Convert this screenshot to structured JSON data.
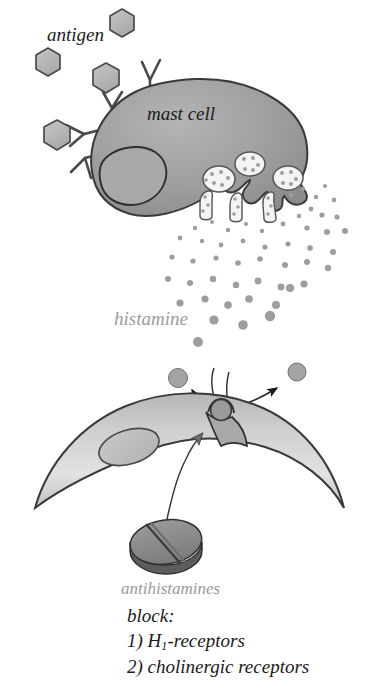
{
  "figure": {
    "width": 367,
    "height": 699,
    "background": "#ffffff"
  },
  "labels": {
    "antigen": "antigen",
    "mast_cell": "mast cell",
    "histamine": "histamine",
    "antihistamines": "antihistamines",
    "block": "block:",
    "receptor_1_prefix": "1) H",
    "receptor_1_sub": "1",
    "receptor_1_suffix": "-receptors",
    "receptor_2": "2) cholinergic receptors"
  },
  "colors": {
    "mast_cell_fill": "#9b9b9b",
    "mast_cell_stroke": "#3a3a3a",
    "nucleus_fill": "#a6a6a6",
    "nucleus_stroke": "#3a3a3a",
    "granule_fill": "#f2f2f2",
    "granule_stroke": "#555555",
    "granule_dot": "#9b9b9b",
    "antigen_fill": "#b4b4b4",
    "antigen_stroke": "#4a4a4a",
    "antibody_fill": "#b0b0b0",
    "antibody_stroke": "#4a4a4a",
    "histamine_dot": "#9b9b9b",
    "target_cell_fill_light": "#dcdcdc",
    "target_cell_fill_dark": "#9d9d9d",
    "target_cell_stroke": "#3a3a3a",
    "tablet_top": "#8f8f8f",
    "tablet_side": "#5a5a5a",
    "tablet_stroke": "#3a3a3a",
    "arrow": "#1a1a1a",
    "label_gray": "#9a9a9a",
    "label_black": "#1a1a1a"
  },
  "elements": {
    "antigen_hexagons": [
      {
        "cx": 122,
        "cy": 23,
        "r": 14
      },
      {
        "cx": 48,
        "cy": 62,
        "r": 14
      },
      {
        "cx": 106,
        "cy": 78,
        "r": 15
      },
      {
        "cx": 57,
        "cy": 135,
        "r": 15
      }
    ],
    "antibodies": [
      {
        "x": 112,
        "y": 92,
        "rot": -18
      },
      {
        "x": 148,
        "y": 73,
        "rot": -6
      },
      {
        "x": 82,
        "y": 118,
        "rot": -44
      },
      {
        "x": 73,
        "y": 148,
        "rot": -72
      }
    ],
    "mast_cell": {
      "cx": 200,
      "cy": 150,
      "rx": 108,
      "ry": 72,
      "label_position": "center-right"
    },
    "nucleus": {
      "cx": 134,
      "cy": 173,
      "shape": "kidney"
    },
    "internal_granules": [
      {
        "cx": 219,
        "cy": 178,
        "r": 15
      },
      {
        "cx": 248,
        "cy": 165,
        "r": 14
      },
      {
        "cx": 286,
        "cy": 179,
        "r": 14
      }
    ],
    "histamine_dot_count": 52,
    "free_histamine_circles": [
      {
        "cx": 178,
        "cy": 378,
        "r": 9
      },
      {
        "cx": 297,
        "cy": 372,
        "r": 9
      }
    ],
    "receptor_bound_histamine": {
      "cx": 220,
      "cy": 411,
      "r": 10
    },
    "arrows": [
      {
        "name": "left-release-arrow",
        "from": "receptor",
        "to": "left-histamine"
      },
      {
        "name": "right-release-arrow",
        "from": "receptor",
        "to": "right-histamine"
      },
      {
        "name": "antihistamine-block-arrow",
        "from": "tablet",
        "to": "receptor"
      }
    ],
    "target_cell": {
      "shape": "crescent",
      "nucleus": {
        "cx": 128,
        "cy": 448,
        "rx": 30,
        "ry": 17,
        "rot": -18
      }
    },
    "tablet": {
      "cx": 165,
      "cy": 544,
      "rx": 35,
      "ry": 20
    }
  }
}
